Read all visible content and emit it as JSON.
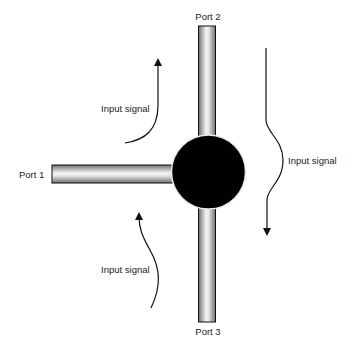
{
  "diagram": {
    "title": "",
    "ports": [
      {
        "id": "port1",
        "label": "Port 1"
      },
      {
        "id": "port2",
        "label": "Port 2"
      },
      {
        "id": "port3",
        "label": "Port 3"
      }
    ],
    "junction": {
      "label": "",
      "color": "#000000"
    },
    "signals": [
      {
        "id": "signal-top-left",
        "label": "Input signal",
        "direction": "up"
      },
      {
        "id": "signal-right",
        "label": "Input signal",
        "direction": "down"
      },
      {
        "id": "signal-bottom-left",
        "label": "Input signal",
        "direction": "up"
      }
    ],
    "colors": {
      "pipe_edge": "#111111",
      "pipe_light": "#f2f2f2",
      "pipe_dark": "#7a7a7a",
      "arrow": "#111111"
    }
  }
}
